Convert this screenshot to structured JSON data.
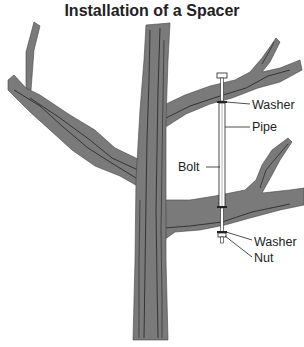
{
  "title": "Installation of a Spacer",
  "colors": {
    "bark": "#7a7a7a",
    "bark_line": "#222222",
    "hardware": "#ffffff",
    "text": "#222222"
  },
  "labels": {
    "washer_top": "Washer",
    "pipe": "Pipe",
    "bolt": "Bolt",
    "washer_bottom": "Washer",
    "nut": "Nut"
  }
}
